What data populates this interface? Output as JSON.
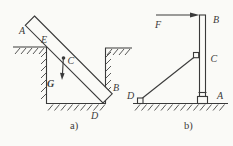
{
  "diagram": {
    "background": "#fafaf7",
    "line_color": "#3a3a3a",
    "figure_a": {
      "caption": "a)",
      "labels": {
        "A": "A",
        "E": "E",
        "C": "C",
        "G": "G",
        "B": "B",
        "D": "D"
      }
    },
    "figure_b": {
      "caption": "b)",
      "labels": {
        "F": "F",
        "B": "B",
        "C": "C",
        "D": "D",
        "A": "A"
      }
    }
  }
}
